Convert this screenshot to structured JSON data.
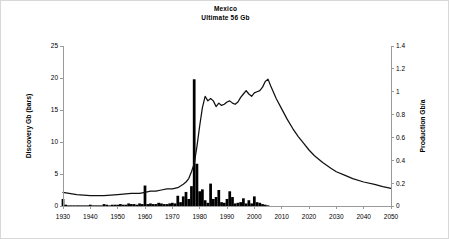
{
  "chart_data": {
    "type": "bar",
    "title": "Mexico",
    "subtitle": "Ultimate  56 Gb",
    "xlabel": "",
    "ylabel": "Discovery Gb (bars)",
    "y2label": "Production Gb/a",
    "xlim": [
      1930,
      2050
    ],
    "ylim": [
      0,
      25
    ],
    "y2lim": [
      0,
      1.4
    ],
    "xticks": [
      1930,
      1940,
      1950,
      1960,
      1970,
      1980,
      1990,
      2000,
      2010,
      2020,
      2030,
      2040,
      2050
    ],
    "yticks": [
      0,
      5,
      10,
      15,
      20,
      25
    ],
    "y2ticks": [
      0,
      0.2,
      0.4,
      0.6,
      0.8,
      1,
      1.2,
      1.4
    ],
    "grid": false,
    "legend": "none",
    "series": [
      {
        "name": "Discovery Gb (bars)",
        "axis": "left",
        "type": "bar",
        "x": [
          1930,
          1931,
          1932,
          1933,
          1934,
          1935,
          1936,
          1937,
          1938,
          1939,
          1940,
          1941,
          1942,
          1943,
          1944,
          1945,
          1946,
          1947,
          1948,
          1949,
          1950,
          1951,
          1952,
          1953,
          1954,
          1955,
          1956,
          1957,
          1958,
          1959,
          1960,
          1961,
          1962,
          1963,
          1964,
          1965,
          1966,
          1967,
          1968,
          1969,
          1970,
          1971,
          1972,
          1973,
          1974,
          1975,
          1976,
          1977,
          1978,
          1979,
          1980,
          1981,
          1982,
          1983,
          1984,
          1985,
          1986,
          1987,
          1988,
          1989,
          1990,
          1991,
          1992,
          1993,
          1994,
          1995,
          1996,
          1997,
          1998,
          1999,
          2000,
          2001,
          2002,
          2003,
          2004,
          2005
        ],
        "values": [
          1.1,
          0.2,
          0.1,
          0.1,
          0.1,
          0.1,
          0.1,
          0.1,
          0.1,
          0.1,
          0.2,
          0.1,
          0.1,
          0.1,
          0.1,
          0.3,
          0.2,
          0.1,
          0.2,
          0.2,
          0.2,
          0.3,
          0.2,
          0.2,
          0.4,
          0.3,
          0.3,
          0.2,
          0.4,
          0.3,
          3.2,
          0.3,
          0.4,
          0.3,
          0.3,
          0.5,
          0.4,
          0.3,
          0.3,
          0.4,
          0.5,
          0.4,
          1.6,
          0.6,
          1.5,
          2.2,
          1.1,
          3.1,
          19.8,
          6.6,
          2.3,
          2.6,
          0.9,
          0.5,
          3.5,
          1.1,
          1.4,
          2.5,
          0.6,
          0.5,
          1.1,
          2.3,
          1.4,
          0.4,
          0.5,
          0.6,
          1.2,
          0.4,
          0.9,
          0.4,
          1.5,
          0.6,
          0.5,
          0.3,
          0.2,
          0.1
        ]
      },
      {
        "name": "Production Gb/a",
        "axis": "right",
        "type": "line",
        "x": [
          1930,
          1935,
          1940,
          1945,
          1950,
          1955,
          1958,
          1960,
          1962,
          1964,
          1966,
          1968,
          1970,
          1972,
          1974,
          1975,
          1976,
          1977,
          1978,
          1979,
          1980,
          1981,
          1982,
          1983,
          1984,
          1985,
          1986,
          1987,
          1988,
          1989,
          1990,
          1991,
          1992,
          1993,
          1994,
          1995,
          1996,
          1997,
          1998,
          1999,
          2000,
          2001,
          2002,
          2003,
          2004,
          2005,
          2006,
          2008,
          2010,
          2012,
          2014,
          2016,
          2018,
          2020,
          2022,
          2025,
          2028,
          2030,
          2033,
          2036,
          2040,
          2044,
          2047,
          2050
        ],
        "values": [
          0.12,
          0.1,
          0.09,
          0.09,
          0.1,
          0.11,
          0.11,
          0.12,
          0.13,
          0.13,
          0.14,
          0.15,
          0.15,
          0.16,
          0.19,
          0.21,
          0.24,
          0.3,
          0.37,
          0.52,
          0.7,
          0.86,
          0.96,
          0.92,
          0.94,
          0.92,
          0.87,
          0.9,
          0.88,
          0.89,
          0.91,
          0.92,
          0.9,
          0.89,
          0.91,
          0.95,
          0.98,
          1.01,
          0.98,
          0.96,
          0.99,
          1.0,
          1.01,
          1.04,
          1.09,
          1.11,
          1.05,
          0.94,
          0.85,
          0.76,
          0.68,
          0.61,
          0.55,
          0.49,
          0.44,
          0.38,
          0.33,
          0.3,
          0.27,
          0.24,
          0.21,
          0.19,
          0.17,
          0.155
        ]
      }
    ]
  }
}
